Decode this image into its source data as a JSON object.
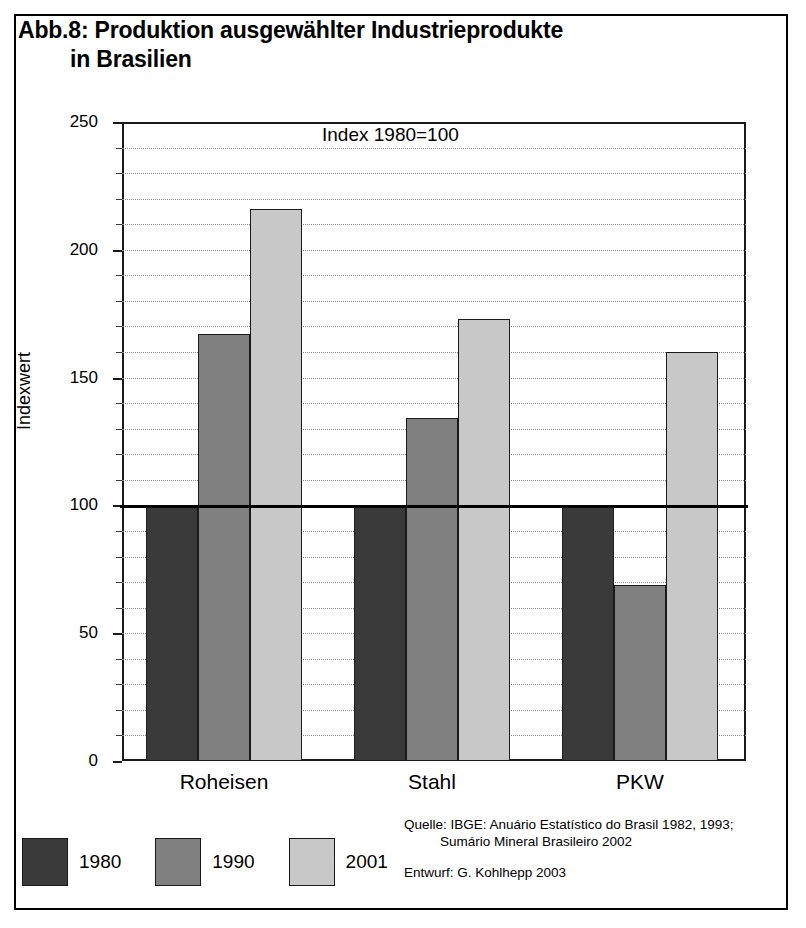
{
  "figure": {
    "title_line1": "Abb.8: Produktion ausgewählter Industrieprodukte",
    "title_line2": "in Brasilien"
  },
  "source": {
    "line1": "Quelle: IBGE: Anuário Estatístico do Brasil 1982, 1993;",
    "line2": "Sumário Mineral Brasileiro 2002",
    "line3": "Entwurf: G. Kohlhepp 2003"
  },
  "legend": {
    "position": "bottom-left",
    "items": [
      {
        "label": "1980",
        "color": "#3a3a3a"
      },
      {
        "label": "1990",
        "color": "#808080"
      },
      {
        "label": "2001",
        "color": "#c8c8c8"
      }
    ]
  },
  "chart_data": {
    "type": "bar",
    "title": "Abb.8: Produktion ausgewählter Industrieprodukte in Brasilien",
    "annotation": "Index 1980=100",
    "xlabel": "",
    "ylabel": "Indexwert",
    "ylim": [
      0,
      250
    ],
    "ytick_labels": [
      "0",
      "50",
      "100",
      "150",
      "200",
      "250"
    ],
    "ytick_values": [
      0,
      50,
      100,
      150,
      200,
      250
    ],
    "minor_tick_step": 10,
    "grid": "horizontal-dotted",
    "reference_line": 100,
    "categories": [
      "Roheisen",
      "Stahl",
      "PKW"
    ],
    "series": [
      {
        "name": "1980",
        "color": "#3a3a3a",
        "values": [
          100,
          100,
          100
        ]
      },
      {
        "name": "1990",
        "color": "#808080",
        "values": [
          167,
          134,
          69
        ]
      },
      {
        "name": "2001",
        "color": "#c8c8c8",
        "values": [
          216,
          173,
          160
        ]
      }
    ]
  }
}
